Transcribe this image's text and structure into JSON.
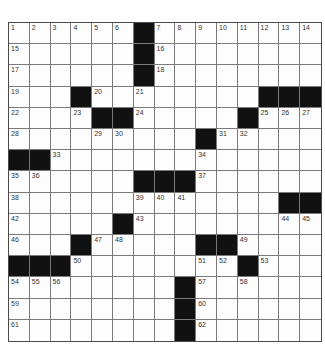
{
  "puzzle": {
    "rows": 15,
    "cols": 15,
    "colors": {
      "block": "#111111",
      "cell": "#fdfdfd",
      "grid_line": "#7a7a7a"
    },
    "blocks": [
      [
        0,
        6
      ],
      [
        1,
        6
      ],
      [
        2,
        6
      ],
      [
        3,
        3
      ],
      [
        3,
        12
      ],
      [
        3,
        13
      ],
      [
        3,
        14
      ],
      [
        4,
        4
      ],
      [
        4,
        5
      ],
      [
        4,
        11
      ],
      [
        5,
        9
      ],
      [
        6,
        0
      ],
      [
        6,
        1
      ],
      [
        7,
        6
      ],
      [
        7,
        7
      ],
      [
        7,
        8
      ],
      [
        8,
        13
      ],
      [
        8,
        14
      ],
      [
        9,
        5
      ],
      [
        10,
        3
      ],
      [
        10,
        9
      ],
      [
        10,
        10
      ],
      [
        11,
        0
      ],
      [
        11,
        1
      ],
      [
        11,
        2
      ],
      [
        11,
        11
      ],
      [
        12,
        8
      ],
      [
        13,
        8
      ],
      [
        14,
        8
      ]
    ],
    "numbers": [
      {
        "r": 0,
        "c": 0,
        "n": "1"
      },
      {
        "r": 0,
        "c": 1,
        "n": "2"
      },
      {
        "r": 0,
        "c": 2,
        "n": "3"
      },
      {
        "r": 0,
        "c": 3,
        "n": "4"
      },
      {
        "r": 0,
        "c": 4,
        "n": "5"
      },
      {
        "r": 0,
        "c": 5,
        "n": "6"
      },
      {
        "r": 0,
        "c": 7,
        "n": "7"
      },
      {
        "r": 0,
        "c": 8,
        "n": "8"
      },
      {
        "r": 0,
        "c": 9,
        "n": "9"
      },
      {
        "r": 0,
        "c": 10,
        "n": "10"
      },
      {
        "r": 0,
        "c": 11,
        "n": "11"
      },
      {
        "r": 0,
        "c": 12,
        "n": "12"
      },
      {
        "r": 0,
        "c": 13,
        "n": "13"
      },
      {
        "r": 0,
        "c": 14,
        "n": "14"
      },
      {
        "r": 1,
        "c": 0,
        "n": "15"
      },
      {
        "r": 1,
        "c": 7,
        "n": "16"
      },
      {
        "r": 2,
        "c": 0,
        "n": "17"
      },
      {
        "r": 2,
        "c": 7,
        "n": "18"
      },
      {
        "r": 3,
        "c": 0,
        "n": "19"
      },
      {
        "r": 3,
        "c": 4,
        "n": "20"
      },
      {
        "r": 3,
        "c": 6,
        "n": "21"
      },
      {
        "r": 4,
        "c": 0,
        "n": "22"
      },
      {
        "r": 4,
        "c": 3,
        "n": "23"
      },
      {
        "r": 4,
        "c": 6,
        "n": "24"
      },
      {
        "r": 4,
        "c": 12,
        "n": "25"
      },
      {
        "r": 4,
        "c": 13,
        "n": "26"
      },
      {
        "r": 4,
        "c": 14,
        "n": "27"
      },
      {
        "r": 5,
        "c": 0,
        "n": "28"
      },
      {
        "r": 5,
        "c": 4,
        "n": "29"
      },
      {
        "r": 5,
        "c": 5,
        "n": "30"
      },
      {
        "r": 5,
        "c": 10,
        "n": "31"
      },
      {
        "r": 5,
        "c": 11,
        "n": "32"
      },
      {
        "r": 6,
        "c": 2,
        "n": "33"
      },
      {
        "r": 6,
        "c": 9,
        "n": "34"
      },
      {
        "r": 7,
        "c": 0,
        "n": "35"
      },
      {
        "r": 7,
        "c": 1,
        "n": "36"
      },
      {
        "r": 7,
        "c": 9,
        "n": "37"
      },
      {
        "r": 8,
        "c": 0,
        "n": "38"
      },
      {
        "r": 8,
        "c": 6,
        "n": "39"
      },
      {
        "r": 8,
        "c": 7,
        "n": "40"
      },
      {
        "r": 8,
        "c": 8,
        "n": "41"
      },
      {
        "r": 9,
        "c": 0,
        "n": "42"
      },
      {
        "r": 9,
        "c": 6,
        "n": "43"
      },
      {
        "r": 9,
        "c": 13,
        "n": "44"
      },
      {
        "r": 9,
        "c": 14,
        "n": "45"
      },
      {
        "r": 10,
        "c": 0,
        "n": "46"
      },
      {
        "r": 10,
        "c": 4,
        "n": "47"
      },
      {
        "r": 10,
        "c": 5,
        "n": "48"
      },
      {
        "r": 10,
        "c": 11,
        "n": "49"
      },
      {
        "r": 11,
        "c": 3,
        "n": "50"
      },
      {
        "r": 11,
        "c": 9,
        "n": "51"
      },
      {
        "r": 11,
        "c": 10,
        "n": "52"
      },
      {
        "r": 11,
        "c": 12,
        "n": "53"
      },
      {
        "r": 12,
        "c": 0,
        "n": "54"
      },
      {
        "r": 12,
        "c": 1,
        "n": "55"
      },
      {
        "r": 12,
        "c": 2,
        "n": "56"
      },
      {
        "r": 12,
        "c": 9,
        "n": "57"
      },
      {
        "r": 12,
        "c": 11,
        "n": "58"
      },
      {
        "r": 13,
        "c": 0,
        "n": "59"
      },
      {
        "r": 13,
        "c": 9,
        "n": "60"
      },
      {
        "r": 14,
        "c": 0,
        "n": "61"
      },
      {
        "r": 14,
        "c": 9,
        "n": "62"
      }
    ]
  }
}
